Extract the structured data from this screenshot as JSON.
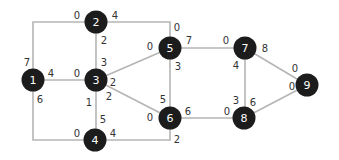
{
  "diagram": {
    "type": "weighted-graph",
    "colors": {
      "node": "#1c1c1c",
      "node_text": "#ffffff",
      "edge": "#b5b5b5",
      "weight_text": "#333333"
    },
    "nodes": [
      {
        "id": "1",
        "label": "1",
        "x": 33,
        "y": 80
      },
      {
        "id": "2",
        "label": "2",
        "x": 96,
        "y": 22
      },
      {
        "id": "3",
        "label": "3",
        "x": 96,
        "y": 80
      },
      {
        "id": "4",
        "label": "4",
        "x": 95,
        "y": 140
      },
      {
        "id": "5",
        "label": "5",
        "x": 170,
        "y": 48
      },
      {
        "id": "6",
        "label": "6",
        "x": 170,
        "y": 118
      },
      {
        "id": "7",
        "label": "7",
        "x": 245,
        "y": 48
      },
      {
        "id": "8",
        "label": "8",
        "x": 244,
        "y": 118
      },
      {
        "id": "9",
        "label": "9",
        "x": 307,
        "y": 85
      }
    ],
    "edges": [
      {
        "from": "1",
        "to": "2",
        "points": [
          [
            33,
            80
          ],
          [
            33,
            22
          ],
          [
            96,
            22
          ]
        ],
        "labels": [
          {
            "text": "7",
            "x": 27,
            "y": 62
          },
          {
            "text": "0",
            "x": 77,
            "y": 15
          }
        ]
      },
      {
        "from": "2",
        "to": "5",
        "points": [
          [
            96,
            22
          ],
          [
            170,
            22
          ],
          [
            170,
            48
          ]
        ],
        "labels": [
          {
            "text": "4",
            "x": 115,
            "y": 15
          },
          {
            "text": "0",
            "x": 177,
            "y": 27
          }
        ]
      },
      {
        "from": "2",
        "to": "3",
        "points": [
          [
            96,
            22
          ],
          [
            96,
            80
          ]
        ],
        "labels": [
          {
            "text": "2",
            "x": 104,
            "y": 40
          },
          {
            "text": "3",
            "x": 104,
            "y": 62
          }
        ]
      },
      {
        "from": "1",
        "to": "3",
        "points": [
          [
            33,
            80
          ],
          [
            96,
            80
          ]
        ],
        "labels": [
          {
            "text": "4",
            "x": 51,
            "y": 73
          },
          {
            "text": "0",
            "x": 77,
            "y": 73
          }
        ]
      },
      {
        "from": "1",
        "to": "4",
        "points": [
          [
            33,
            80
          ],
          [
            33,
            140
          ],
          [
            95,
            140
          ]
        ],
        "labels": [
          {
            "text": "6",
            "x": 40,
            "y": 99
          },
          {
            "text": "0",
            "x": 77,
            "y": 133
          }
        ]
      },
      {
        "from": "3",
        "to": "4",
        "points": [
          [
            96,
            80
          ],
          [
            96,
            140
          ]
        ],
        "labels": [
          {
            "text": "1",
            "x": 89,
            "y": 102
          },
          {
            "text": "5",
            "x": 103,
            "y": 119
          }
        ]
      },
      {
        "from": "3",
        "to": "5",
        "points": [
          [
            96,
            80
          ],
          [
            170,
            48
          ]
        ],
        "labels": [
          {
            "text": "2",
            "x": 113,
            "y": 82
          },
          {
            "text": "0",
            "x": 150,
            "y": 46
          }
        ]
      },
      {
        "from": "3",
        "to": "6",
        "points": [
          [
            96,
            80
          ],
          [
            170,
            118
          ]
        ],
        "labels": [
          {
            "text": "2",
            "x": 109,
            "y": 96
          },
          {
            "text": "0",
            "x": 150,
            "y": 117
          }
        ]
      },
      {
        "from": "4",
        "to": "6",
        "points": [
          [
            95,
            140
          ],
          [
            170,
            140
          ],
          [
            170,
            118
          ]
        ],
        "labels": [
          {
            "text": "4",
            "x": 113,
            "y": 133
          },
          {
            "text": "2",
            "x": 177,
            "y": 139
          }
        ]
      },
      {
        "from": "5",
        "to": "6",
        "points": [
          [
            170,
            48
          ],
          [
            170,
            118
          ]
        ],
        "labels": [
          {
            "text": "3",
            "x": 178,
            "y": 66
          },
          {
            "text": "5",
            "x": 163,
            "y": 99
          }
        ]
      },
      {
        "from": "5",
        "to": "7",
        "points": [
          [
            170,
            48
          ],
          [
            245,
            48
          ]
        ],
        "labels": [
          {
            "text": "7",
            "x": 189,
            "y": 40
          },
          {
            "text": "0",
            "x": 226,
            "y": 40
          }
        ]
      },
      {
        "from": "6",
        "to": "8",
        "points": [
          [
            170,
            118
          ],
          [
            244,
            118
          ]
        ],
        "labels": [
          {
            "text": "6",
            "x": 188,
            "y": 111
          },
          {
            "text": "0",
            "x": 227,
            "y": 111
          }
        ]
      },
      {
        "from": "7",
        "to": "8",
        "points": [
          [
            245,
            48
          ],
          [
            245,
            118
          ]
        ],
        "labels": [
          {
            "text": "4",
            "x": 236,
            "y": 65
          },
          {
            "text": "3",
            "x": 236,
            "y": 100
          }
        ]
      },
      {
        "from": "7",
        "to": "9",
        "points": [
          [
            245,
            48
          ],
          [
            307,
            85
          ]
        ],
        "labels": [
          {
            "text": "8",
            "x": 265,
            "y": 48
          },
          {
            "text": "0",
            "x": 295,
            "y": 68
          }
        ]
      },
      {
        "from": "8",
        "to": "9",
        "points": [
          [
            244,
            118
          ],
          [
            307,
            85
          ]
        ],
        "labels": [
          {
            "text": "6",
            "x": 253,
            "y": 102
          },
          {
            "text": "0",
            "x": 292,
            "y": 86
          }
        ]
      }
    ]
  }
}
